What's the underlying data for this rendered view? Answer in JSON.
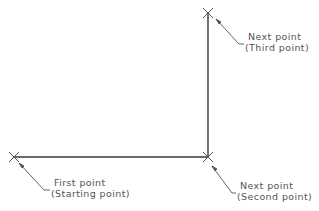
{
  "diagram": {
    "colors": {
      "line": "#3a3a3a",
      "leader": "#555555",
      "text": "#555555",
      "background": "#ffffff"
    },
    "points": [
      {
        "id": "first",
        "x": 14,
        "y": 157,
        "marker": "x-marker",
        "label_line1": "First point",
        "label_line2": "(Starting point)"
      },
      {
        "id": "second",
        "x": 208,
        "y": 157,
        "marker": "x-marker",
        "label_line1": "Next point",
        "label_line2": "(Second point)"
      },
      {
        "id": "third",
        "x": 208,
        "y": 13,
        "marker": "x-marker",
        "label_line1": "Next point",
        "label_line2": "(Third point)"
      }
    ],
    "segments": [
      {
        "from": "first",
        "to": "second"
      },
      {
        "from": "second",
        "to": "third"
      }
    ]
  }
}
